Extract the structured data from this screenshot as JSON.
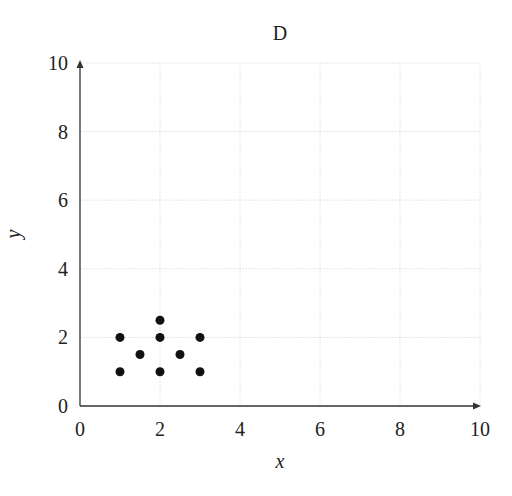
{
  "chart_data": {
    "type": "scatter",
    "title": "D",
    "xlabel": "x",
    "ylabel": "y",
    "xlim": [
      0,
      10
    ],
    "ylim": [
      0,
      10
    ],
    "xticks": [
      0,
      2,
      4,
      6,
      8,
      10
    ],
    "yticks": [
      0,
      2,
      4,
      6,
      8,
      10
    ],
    "grid": true,
    "legend": null,
    "series": [
      {
        "name": "points",
        "color": "#111111",
        "x": [
          1,
          2,
          2,
          3,
          1.5,
          2.5,
          1,
          2,
          3
        ],
        "y": [
          2,
          2.5,
          2,
          2,
          1.5,
          1.5,
          1,
          1,
          1
        ]
      }
    ]
  }
}
